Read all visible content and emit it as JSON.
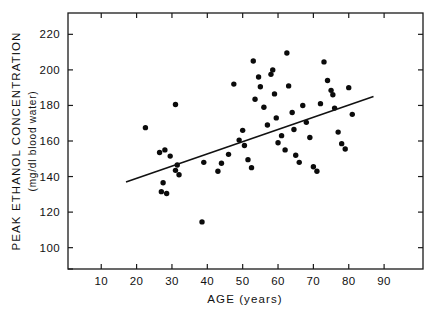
{
  "chart_data": {
    "type": "scatter",
    "title": "",
    "xlabel": "AGE (years)",
    "ylabel": "PEAK ETHANOL CONCENTRATION",
    "ylabel_units": "(mg/dl blood water)",
    "xlim": [
      0.6,
      101
    ],
    "ylim": [
      88,
      232
    ],
    "xticks": [
      10,
      20,
      30,
      40,
      50,
      60,
      70,
      80,
      90
    ],
    "xtick_labels": [
      "10",
      "20",
      "30",
      "40",
      "50",
      "60",
      "70",
      "80",
      "90"
    ],
    "yticks": [
      100,
      120,
      140,
      160,
      180,
      200,
      220
    ],
    "ytick_labels": [
      "100",
      "120",
      "140",
      "160",
      "180",
      "200",
      "220"
    ],
    "grid": false,
    "legend": null,
    "marker": "filled-circle",
    "marker_color": "#0b0b0b",
    "line_color": "#111111",
    "frame_color": "#1a1a1a",
    "background": "#ffffff",
    "x": [
      22.5,
      31.0,
      26.5,
      38.5,
      28.0,
      29.5,
      31.5,
      31.0,
      32.0,
      27.5,
      27.0,
      28.5,
      39.0,
      44.0,
      47.5,
      49.0,
      50.0,
      50.5,
      51.5,
      52.5,
      53.0,
      53.5,
      54.5,
      55.0,
      56.0,
      57.0,
      58.0,
      58.5,
      59.0,
      59.5,
      60.0,
      61.0,
      62.0,
      62.5,
      63.0,
      64.0,
      64.5,
      65.0,
      66.0,
      67.0,
      68.0,
      69.0,
      70.0,
      71.0,
      72.0,
      73.0,
      74.0,
      75.0,
      75.5,
      76.0,
      77.0,
      78.0,
      79.0,
      80.0,
      81.0,
      46.0,
      43.0
    ],
    "y": [
      167.5,
      180.5,
      153.5,
      114.5,
      155.0,
      151.5,
      146.5,
      143.5,
      141.0,
      136.5,
      131.5,
      130.5,
      148.0,
      147.5,
      192.0,
      160.5,
      166.0,
      157.5,
      149.5,
      145.0,
      205.0,
      183.5,
      196.0,
      190.5,
      179.0,
      169.0,
      197.5,
      200.0,
      186.5,
      173.0,
      159.0,
      163.0,
      155.0,
      209.5,
      191.0,
      176.0,
      166.5,
      152.0,
      148.0,
      180.0,
      170.5,
      162.0,
      145.5,
      143.0,
      181.0,
      204.5,
      194.0,
      188.5,
      186.0,
      178.5,
      165.0,
      158.5,
      155.5,
      190.0,
      175.0,
      152.5,
      143.0
    ],
    "fit_line": {
      "x0": 17.0,
      "y0": 137.0,
      "x1": 87.0,
      "y1": 185.0,
      "label": "regression line"
    },
    "n_points": 57
  }
}
